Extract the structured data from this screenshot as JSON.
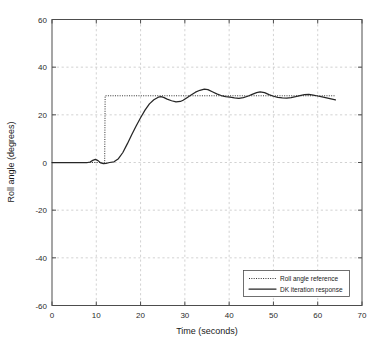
{
  "chart_data": {
    "type": "line",
    "title": "",
    "xlabel": "Time (seconds)",
    "ylabel": "Roll angle (degrees)",
    "xlim": [
      0,
      70
    ],
    "ylim": [
      -60,
      60
    ],
    "xticks": [
      0,
      10,
      20,
      30,
      40,
      50,
      60,
      70
    ],
    "yticks": [
      -60,
      -40,
      -20,
      0,
      20,
      40,
      60
    ],
    "xtick_labels": [
      "0",
      "10",
      "20",
      "30",
      "40",
      "50",
      "60",
      "70"
    ],
    "ytick_labels": [
      "-60",
      "-40",
      "-20",
      "0",
      "20",
      "40",
      "60"
    ],
    "grid": true,
    "legend_position": "lower right",
    "series": [
      {
        "name": "Roll angle reference",
        "style": "dotted",
        "color": "#303030",
        "x": [
          0,
          2,
          4,
          6,
          8,
          10,
          11.9,
          12,
          16,
          20,
          24,
          28,
          32,
          36,
          40,
          44,
          48,
          52,
          56,
          60,
          64
        ],
        "y": [
          0,
          0,
          0,
          0,
          0,
          0,
          0,
          28,
          28,
          28,
          28,
          28,
          28,
          28,
          28,
          28,
          28,
          28,
          28,
          28,
          28
        ]
      },
      {
        "name": "DK iteration response",
        "style": "solid",
        "color": "#262626",
        "x": [
          0,
          1,
          2,
          3,
          4,
          5,
          6,
          7,
          8,
          8.6,
          9.2,
          9.8,
          10.4,
          11,
          11.6,
          12.2,
          13,
          14,
          15,
          16,
          17,
          18,
          19,
          20,
          21,
          22,
          23,
          24,
          24.6,
          25.2,
          26,
          27,
          28,
          29,
          29.6,
          30.4,
          31.4,
          32.4,
          33.4,
          34.4,
          35.2,
          36.2,
          37.2,
          38.2,
          39.2,
          40.2,
          41.2,
          42.2,
          43.2,
          44.2,
          45.2,
          46.2,
          47,
          48,
          49,
          50,
          51,
          52,
          53,
          54,
          55,
          56,
          57,
          58,
          59,
          60,
          61,
          62,
          63,
          64
        ],
        "y": [
          0,
          0,
          0,
          0,
          0,
          0,
          0,
          0,
          0,
          0.2,
          0.9,
          1.3,
          0.8,
          -0.2,
          -0.5,
          -0.4,
          0,
          0.3,
          1.6,
          4.2,
          7.8,
          11.6,
          15.3,
          18.8,
          22.0,
          24.6,
          26.3,
          27.4,
          27.6,
          27.3,
          26.6,
          25.9,
          25.4,
          25.6,
          26.1,
          27.1,
          28.3,
          29.5,
          30.3,
          30.8,
          30.6,
          29.7,
          28.8,
          28.1,
          27.6,
          27.4,
          27.1,
          26.9,
          27.2,
          27.8,
          28.6,
          29.3,
          29.6,
          29.3,
          28.5,
          27.8,
          27.3,
          27.1,
          27.0,
          27.2,
          27.6,
          28.1,
          28.5,
          28.6,
          28.3,
          27.9,
          27.5,
          27.1,
          26.7,
          26.3
        ]
      }
    ]
  },
  "legend": {
    "entries": [
      {
        "label": "Roll angle reference"
      },
      {
        "label": "DK iteration response"
      }
    ]
  }
}
